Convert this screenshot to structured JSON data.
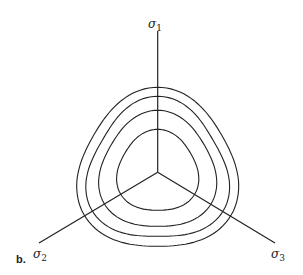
{
  "figure": {
    "panel_label": "b.",
    "axes": [
      {
        "id": "sigma1",
        "symbol": "σ",
        "subscript": "1"
      },
      {
        "id": "sigma2",
        "symbol": "σ",
        "subscript": "2"
      },
      {
        "id": "sigma3",
        "symbol": "σ",
        "subscript": "3"
      }
    ],
    "contour_count": 4,
    "line_color": "#222222",
    "background": "#ffffff"
  }
}
